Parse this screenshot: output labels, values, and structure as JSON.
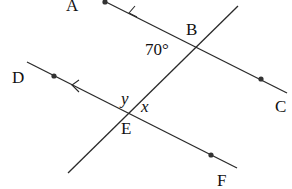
{
  "diagram": {
    "type": "parallel-lines-transversal",
    "points": {
      "A": "A",
      "B": "B",
      "C": "C",
      "D": "D",
      "E": "E",
      "F": "F"
    },
    "angles": {
      "given": "70°",
      "x": "x",
      "y": "y"
    },
    "colors": {
      "line": "#2a2a2a",
      "text": "#111111"
    }
  }
}
